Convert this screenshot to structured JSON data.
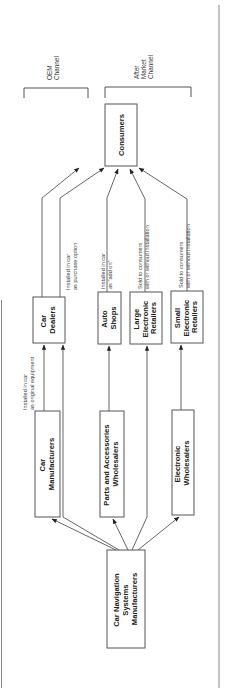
{
  "diagram": {
    "orientation": "rotated-90-ccw",
    "colors": {
      "stroke": "#555555",
      "text": "#222222",
      "background": "#ffffff"
    },
    "nodes": {
      "source": {
        "lines": [
          "Car Navigation",
          "Systems",
          "Manufacturers"
        ]
      },
      "car_manufacturers": {
        "lines": [
          "Car",
          "Manufacturers"
        ]
      },
      "parts_wholesalers": {
        "lines": [
          "Parts and Accessories",
          "Wholesalers"
        ]
      },
      "electronic_wholesalers": {
        "lines": [
          "Electronic",
          "Wholesalers"
        ]
      },
      "car_dealers": {
        "lines": [
          "Car",
          "Dealers"
        ]
      },
      "auto_shops": {
        "lines": [
          "Auto",
          "Shops"
        ]
      },
      "large_retailers": {
        "lines": [
          "Large",
          "Electronic",
          "Retailers"
        ]
      },
      "small_retailers": {
        "lines": [
          "Small",
          "Electronic",
          "Retailers"
        ]
      },
      "consumers": {
        "lines": [
          "Consumers"
        ]
      }
    },
    "edge_labels": {
      "original_equipment": {
        "lines": [
          "Installed in car",
          "as original equipment"
        ]
      },
      "purchase_option": {
        "lines": [
          "Installed in car",
          "as purchase option"
        ]
      },
      "add_on": {
        "lines": [
          "Installed in car",
          "as \"add on\""
        ]
      },
      "large_sold": {
        "lines": [
          "Sold to consumers",
          "with or without installation"
        ]
      },
      "small_sold": {
        "lines": [
          "Sold to consumers",
          "with or without installation"
        ]
      }
    },
    "channels": {
      "oem": {
        "lines": [
          "OEM",
          "Channel"
        ]
      },
      "aftermarket": {
        "lines": [
          "After",
          "Market",
          "Channel"
        ]
      }
    }
  }
}
